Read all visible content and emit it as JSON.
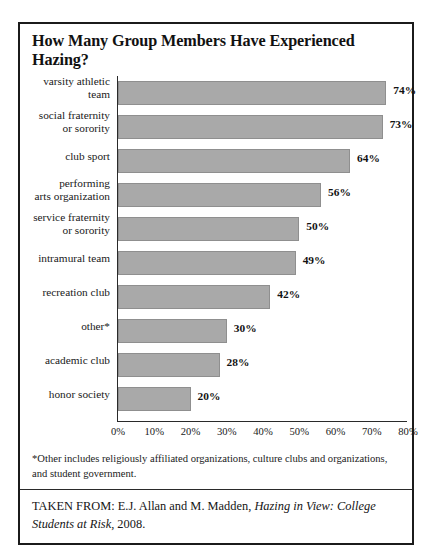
{
  "figure": {
    "title": "How Many Group Members Have Experienced Hazing?",
    "footnote": "*Other includes religiously affiliated organizations, culture clubs and organizations, and student government.",
    "source_prefix": "TAKEN FROM: E.J. Allan and M. Madden, ",
    "source_title": "Hazing in View: College Students at Risk",
    "source_suffix": ", 2008."
  },
  "chart_data": {
    "type": "bar",
    "orientation": "horizontal",
    "title": "How Many Group Members Have Experienced Hazing?",
    "xlabel": "",
    "ylabel": "",
    "xlim": [
      0,
      80
    ],
    "grid": false,
    "legend": false,
    "bar_color": "#a9a9a9",
    "value_suffix": "%",
    "xticks": [
      "0%",
      "10%",
      "20%",
      "30%",
      "40%",
      "50%",
      "60%",
      "70%",
      "80%"
    ],
    "xtick_values": [
      0,
      10,
      20,
      30,
      40,
      50,
      60,
      70,
      80
    ],
    "categories": [
      "varsity athletic team",
      "social fraternity or sorority",
      "club sport",
      "performing arts organization",
      "service fraternity or sorority",
      "intramural team",
      "recreation club",
      "other*",
      "academic club",
      "honor society"
    ],
    "category_lines": [
      [
        "varsity athletic",
        "team"
      ],
      [
        "social fraternity",
        "or sorority"
      ],
      [
        "club sport"
      ],
      [
        "performing",
        "arts organization"
      ],
      [
        "service fraternity",
        "or sorority"
      ],
      [
        "intramural team"
      ],
      [
        "recreation club"
      ],
      [
        "other*"
      ],
      [
        "academic club"
      ],
      [
        "honor society"
      ]
    ],
    "values": [
      74,
      73,
      64,
      56,
      50,
      49,
      42,
      30,
      28,
      20
    ],
    "value_labels": [
      "74%",
      "73%",
      "64%",
      "56%",
      "50%",
      "49%",
      "42%",
      "30%",
      "28%",
      "20%"
    ]
  }
}
